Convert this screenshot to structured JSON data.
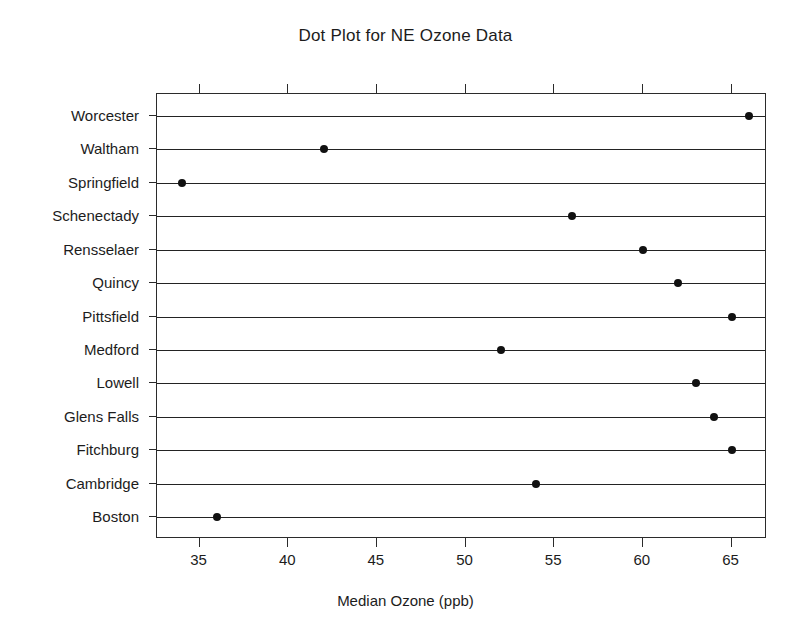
{
  "chart_data": {
    "type": "scatter",
    "title": "Dot Plot for NE Ozone Data",
    "xlabel": "Median Ozone (ppb)",
    "ylabel": "",
    "orientation": "horizontal",
    "grid": false,
    "legend": "none",
    "xlim": [
      32.6,
      67.0
    ],
    "xticks": [
      35,
      40,
      45,
      50,
      55,
      60,
      65
    ],
    "xtick_labels": [
      "35",
      "40",
      "45",
      "50",
      "55",
      "60",
      "65"
    ],
    "categories": [
      "Worcester",
      "Waltham",
      "Springfield",
      "Schenectady",
      "Rensselaer",
      "Quincy",
      "Pittsfield",
      "Medford",
      "Lowell",
      "Glens Falls",
      "Fitchburg",
      "Cambridge",
      "Boston"
    ],
    "values": [
      66,
      42,
      34,
      56,
      60,
      62,
      65,
      52,
      63,
      64,
      65,
      54,
      36
    ],
    "points": [
      {
        "label": "Worcester",
        "value": 66
      },
      {
        "label": "Waltham",
        "value": 42
      },
      {
        "label": "Springfield",
        "value": 34
      },
      {
        "label": "Schenectady",
        "value": 56
      },
      {
        "label": "Rensselaer",
        "value": 60
      },
      {
        "label": "Quincy",
        "value": 62
      },
      {
        "label": "Pittsfield",
        "value": 65
      },
      {
        "label": "Medford",
        "value": 52
      },
      {
        "label": "Lowell",
        "value": 63
      },
      {
        "label": "Glens Falls",
        "value": 64
      },
      {
        "label": "Fitchburg",
        "value": 65
      },
      {
        "label": "Cambridge",
        "value": 54
      },
      {
        "label": "Boston",
        "value": 36
      }
    ],
    "colors": {
      "dot": "#111111",
      "line": "#232323",
      "axis": "#2b2b2b",
      "text": "#1c1c1c",
      "background": "#ffffff"
    }
  }
}
